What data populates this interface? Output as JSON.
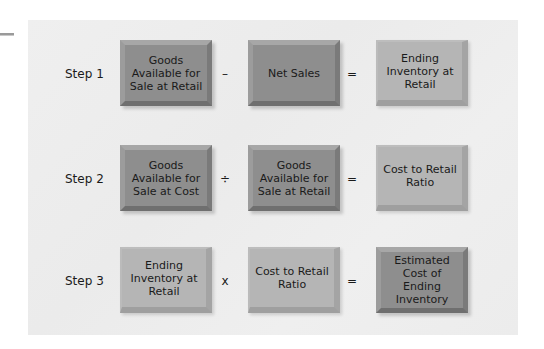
{
  "diagram": {
    "colors": {
      "panel": "#ededed",
      "dark_box": "#8e8e8e",
      "light_box": "#b5b5b5",
      "text": "#1a1a1a"
    },
    "steps": [
      {
        "label": "Step 1",
        "operand1": {
          "text": "Goods Available for Sale at Retail",
          "style": "dark"
        },
        "operator": "–",
        "operand2": {
          "text": "Net Sales",
          "style": "dark"
        },
        "equals": "=",
        "result": {
          "text": "Ending Inventory at Retail",
          "style": "light"
        }
      },
      {
        "label": "Step 2",
        "operand1": {
          "text": "Goods Available for Sale at Cost",
          "style": "dark"
        },
        "operator": "÷",
        "operand2": {
          "text": "Goods Available for Sale at Retail",
          "style": "dark"
        },
        "equals": "=",
        "result": {
          "text": "Cost to Retail Ratio",
          "style": "light"
        }
      },
      {
        "label": "Step 3",
        "operand1": {
          "text": "Ending Inventory at Retail",
          "style": "light"
        },
        "operator": "x",
        "operand2": {
          "text": "Cost to Retail Ratio",
          "style": "light"
        },
        "equals": "=",
        "result": {
          "text": "Estimated Cost of Ending Inventory",
          "style": "dark"
        }
      }
    ]
  }
}
